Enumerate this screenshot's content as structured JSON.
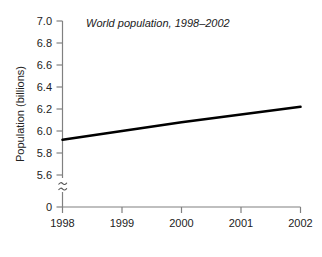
{
  "chart_data": {
    "type": "line",
    "title": "World population, 1998–2002",
    "xlabel": "",
    "ylabel": "Population (billions)",
    "x": [
      1998,
      1999,
      2000,
      2001,
      2002
    ],
    "xtick_labels": [
      "1998",
      "1999",
      "2000",
      "2001",
      "2002"
    ],
    "values": [
      5.92,
      6.0,
      6.08,
      6.15,
      6.22
    ],
    "series": [
      {
        "name": "World population",
        "values": [
          5.92,
          6.0,
          6.08,
          6.15,
          6.22
        ]
      }
    ],
    "ytick_labels": [
      "0",
      "5.6",
      "5.8",
      "6.0",
      "6.2",
      "6.4",
      "6.6",
      "6.8",
      "7.0"
    ],
    "ytick_values": [
      0,
      5.6,
      5.8,
      6.0,
      6.2,
      6.4,
      6.6,
      6.8,
      7.0
    ],
    "ylim": [
      5.6,
      7.0
    ],
    "xlim": [
      1998,
      2002
    ],
    "axis_break": true,
    "axis_break_symbol": "≈",
    "grid": false,
    "legend": false,
    "legend_position": "none",
    "line_color": "#000000",
    "axis_color": "#808080",
    "background_color": "#ffffff"
  },
  "labels": {
    "y_0": "0",
    "y_56": "5.6",
    "y_58": "5.8",
    "y_60": "6.0",
    "y_62": "6.2",
    "y_64": "6.4",
    "y_66": "6.6",
    "y_68": "6.8",
    "y_70": "7.0",
    "x_1998": "1998",
    "x_1999": "1999",
    "x_2000": "2000",
    "x_2001": "2001",
    "x_2002": "2002"
  }
}
